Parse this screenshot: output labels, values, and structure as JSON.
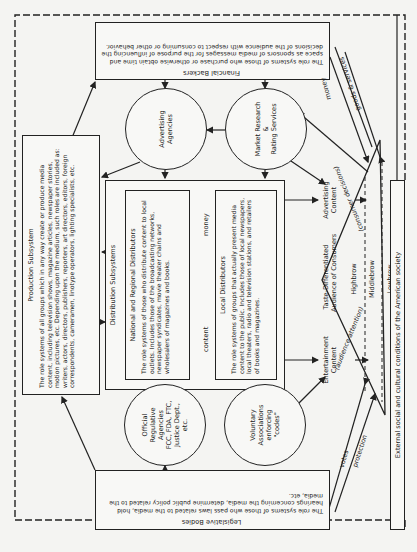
{
  "diagram": {
    "production": {
      "title": "Production Subsystem",
      "text": "The role systems of all groups which in any way create or produce media content, including television shows, magazine articles, newspaper stories, motion pictures, etc. Depending upon the medium, such roles are included as: writers, actors, directors, publishers, reporters, art directors, editors, foreign correspondents, cameramen, linotype operators, lighting specialists, etc."
    },
    "financial_backers": {
      "title": "Financial Backers",
      "text": "The role systems of those who purchase or otherwise obtain time and space as sponsors of media messages for the purpose of influencing the decisions of the audience with respect to consuming or other behavior."
    },
    "legislative_bodies": {
      "title": "Legislative Bodies",
      "text": "The role systems of those who pass laws related to the media, hold hearings concerning the media, determine public policy related to the media, etc."
    },
    "advertising_agencies": {
      "line1": "Advertising",
      "line2": "Agencies"
    },
    "market_research": {
      "line1": "Market Research",
      "line2": "&",
      "line3": "Rating Services"
    },
    "distribution": {
      "title": "Distribution Subsystems",
      "national": {
        "title": "National and Regional Distributors",
        "text": "The role systems of those who distribute content to local outlets. Includes those of the broadcasting networks, newspaper syndicates, movie theater chains and wholesalers of magazines and books."
      },
      "local": {
        "title": "Local Distributors",
        "text": "The role systems of groups that actually present media content to the public. Includes those of local newspapers, local theaters, radio and television stations, and retailers of books and magazines."
      },
      "content_label": "content",
      "money_label": "money"
    },
    "official_agencies": {
      "line1": "Official",
      "line2": "Regulative",
      "line3": "Agencies",
      "line4": "FCC, FDA, FTC,",
      "line5": "Justice Dept.,",
      "line6": "etc."
    },
    "voluntary_associations": {
      "line1": "Voluntary",
      "line2": "Associations",
      "line3": "enforcing",
      "line4": "\"codes\""
    },
    "advertising_content": {
      "line1": "Advertising",
      "line2": "Content"
    },
    "entertainment_content": {
      "line1": "Entertainment",
      "line2": "Content"
    },
    "audience": {
      "title1": "Taste-Differentiated",
      "title2": "Audience of Consumers",
      "tiers": [
        "Highbrow",
        "Middlebrow",
        "Lowbrow"
      ],
      "consumer_decisions": "(consumer decisions)",
      "audience_attention": "(audience attention)"
    },
    "flows": {
      "money": "money",
      "goods_services": "goods & services",
      "votes": "votes",
      "protection": "protection"
    },
    "external": "External social and cultural conditions of the American society"
  }
}
